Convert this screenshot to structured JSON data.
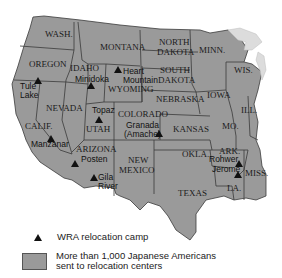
{
  "map": {
    "title": "WRA Relocation Camps",
    "fill_color": "#9a9a9a",
    "states": [
      {
        "id": "wash",
        "label": "WASH.",
        "x": 45,
        "y": 37
      },
      {
        "id": "oregon",
        "label": "OREGON",
        "x": 29,
        "y": 67
      },
      {
        "id": "idaho",
        "label": "IDAHO",
        "x": 72,
        "y": 71
      },
      {
        "id": "montana",
        "label": "MONTANA",
        "x": 100,
        "y": 50
      },
      {
        "id": "wyoming",
        "label": "WYOMING",
        "x": 108,
        "y": 90
      },
      {
        "id": "nevada",
        "label": "NEVADA",
        "x": 46,
        "y": 111
      },
      {
        "id": "calif",
        "label": "CALIF.",
        "x": 26,
        "y": 129
      },
      {
        "id": "utah",
        "label": "UTAH",
        "x": 86,
        "y": 131
      },
      {
        "id": "arizona",
        "label": "ARIZONA",
        "x": 76,
        "y": 152
      },
      {
        "id": "colorado",
        "label": "COLORADO",
        "x": 119,
        "y": 118
      },
      {
        "id": "new-mexico",
        "label": "NEW",
        "x": 122,
        "y": 163
      },
      {
        "id": "new-mexico-2",
        "label": "MEXICO",
        "x": 116,
        "y": 174
      },
      {
        "id": "north-dakota",
        "label": "NORTH",
        "x": 160,
        "y": 45
      },
      {
        "id": "north-dakota-2",
        "label": "DAKOTA",
        "x": 157,
        "y": 55
      },
      {
        "id": "south-dakota",
        "label": "SOUTH",
        "x": 161,
        "y": 73
      },
      {
        "id": "south-dakota-2",
        "label": "DAKOTA",
        "x": 158,
        "y": 83
      },
      {
        "id": "minn",
        "label": "MINN.",
        "x": 199,
        "y": 53
      },
      {
        "id": "wis",
        "label": "WIS.",
        "x": 234,
        "y": 73
      },
      {
        "id": "iowa",
        "label": "IOWA",
        "x": 207,
        "y": 98
      },
      {
        "id": "nebraska",
        "label": "NEBRASKA",
        "x": 156,
        "y": 102
      },
      {
        "id": "ill",
        "label": "ILL.",
        "x": 241,
        "y": 114
      },
      {
        "id": "kansas",
        "label": "KANSAS",
        "x": 173,
        "y": 132
      },
      {
        "id": "mo",
        "label": "MO.",
        "x": 222,
        "y": 129
      },
      {
        "id": "okla",
        "label": "OKLA.",
        "x": 182,
        "y": 157
      },
      {
        "id": "ark",
        "label": "ARK.",
        "x": 219,
        "y": 154
      },
      {
        "id": "texas",
        "label": "TEXAS",
        "x": 178,
        "y": 196
      },
      {
        "id": "la",
        "label": "LA.",
        "x": 227,
        "y": 191
      },
      {
        "id": "miss",
        "label": "MISS.",
        "x": 245,
        "y": 176
      }
    ],
    "camps": [
      {
        "name": "Tule",
        "name2": "Lake",
        "tx": 38,
        "ty": 81,
        "lx": 20,
        "ly": 88
      },
      {
        "name": "Minidoka",
        "tx": 91,
        "ty": 84,
        "lx": 75,
        "ly": 81
      },
      {
        "name": "Heart",
        "name2": "Mountain",
        "tx": 118,
        "ty": 69,
        "lx": 122,
        "ly": 74
      },
      {
        "name": "Topaz",
        "tx": 99,
        "ty": 118,
        "lx": 92,
        "ly": 113
      },
      {
        "name": "Granada",
        "name2": "(Amache)",
        "tx": 159,
        "ty": 140,
        "lx": 124,
        "ly": 128
      },
      {
        "name": "Manzanar",
        "tx": 51,
        "ty": 138,
        "lx": 30,
        "ly": 147
      },
      {
        "name": "Posten",
        "tx": 75,
        "ty": 162,
        "lx": 81,
        "ly": 162
      },
      {
        "name": "Gila",
        "name2": "River",
        "tx": 94,
        "ty": 176,
        "lx": 98,
        "ly": 180
      },
      {
        "name": "Rohwer",
        "tx": 238,
        "ty": 163,
        "lx": 209,
        "ly": 162
      },
      {
        "name": "Jerome",
        "tx": 238,
        "ty": 175,
        "lx": 212,
        "ly": 172
      }
    ]
  },
  "legend": {
    "camp_label": "WRA relocation camp",
    "area_label_line1": "More than 1,000 Japanese Americans",
    "area_label_line2": "sent to relocation centers"
  }
}
